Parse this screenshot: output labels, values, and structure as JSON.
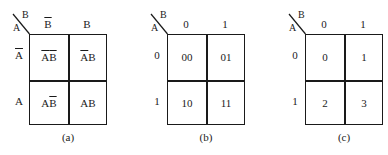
{
  "maps": [
    {
      "id": "a",
      "caption": "(a)",
      "row_var": "A",
      "col_var": "B",
      "col_labels": [
        {
          "text": "B",
          "overline": true
        },
        {
          "text": "B",
          "overline": false
        }
      ],
      "row_labels": [
        {
          "text": "A",
          "overline": true
        },
        {
          "text": "A",
          "overline": false
        }
      ],
      "cells": [
        [
          {
            "parts": [
              {
                "t": "A",
                "o": true
              },
              {
                "t": "B",
                "o": true
              }
            ]
          },
          {
            "parts": [
              {
                "t": "A",
                "o": true
              },
              {
                "t": "B",
                "o": false
              }
            ]
          }
        ],
        [
          {
            "parts": [
              {
                "t": "A",
                "o": false
              },
              {
                "t": "B",
                "o": true
              }
            ]
          },
          {
            "parts": [
              {
                "t": "A",
                "o": false
              },
              {
                "t": "B",
                "o": false
              }
            ]
          }
        ]
      ]
    },
    {
      "id": "b",
      "caption": "(b)",
      "row_var": "A",
      "col_var": "B",
      "col_labels": [
        {
          "text": "0",
          "overline": false
        },
        {
          "text": "1",
          "overline": false
        }
      ],
      "row_labels": [
        {
          "text": "0",
          "overline": false
        },
        {
          "text": "1",
          "overline": false
        }
      ],
      "cells": [
        [
          {
            "parts": [
              {
                "t": "00",
                "o": false
              }
            ]
          },
          {
            "parts": [
              {
                "t": "01",
                "o": false
              }
            ]
          }
        ],
        [
          {
            "parts": [
              {
                "t": "10",
                "o": false
              }
            ]
          },
          {
            "parts": [
              {
                "t": "11",
                "o": false
              }
            ]
          }
        ]
      ]
    },
    {
      "id": "c",
      "caption": "(c)",
      "row_var": "A",
      "col_var": "B",
      "col_labels": [
        {
          "text": "0",
          "overline": false
        },
        {
          "text": "1",
          "overline": false
        }
      ],
      "row_labels": [
        {
          "text": "0",
          "overline": false
        },
        {
          "text": "1",
          "overline": false
        }
      ],
      "cells": [
        [
          {
            "parts": [
              {
                "t": "0",
                "o": false
              }
            ]
          },
          {
            "parts": [
              {
                "t": "1",
                "o": false
              }
            ]
          }
        ],
        [
          {
            "parts": [
              {
                "t": "2",
                "o": false
              }
            ]
          },
          {
            "parts": [
              {
                "t": "3",
                "o": false
              }
            ]
          }
        ]
      ]
    }
  ],
  "colors": {
    "line": "#1a1a1a",
    "background": "#ffffff"
  }
}
